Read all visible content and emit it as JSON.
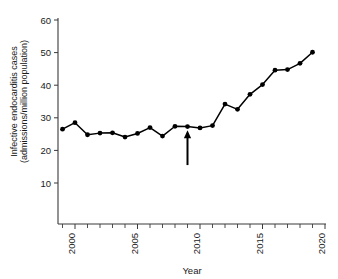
{
  "chart_data": {
    "type": "line",
    "title": "",
    "xlabel": "Year",
    "ylabel": "Infective endocarditis cases (admissions/million population)",
    "ylabel_line1": "Infective endocarditis cases",
    "ylabel_line2": "(admissions/million population)",
    "xlim": [
      1998.2,
      2020.6
    ],
    "ylim": [
      4,
      61
    ],
    "grid": false,
    "legend": "none",
    "x": [
      1999,
      2000,
      2001,
      2002,
      2003,
      2004,
      2005,
      2006,
      2007,
      2008,
      2009,
      2010,
      2011,
      2012,
      2013,
      2014,
      2015,
      2016,
      2017,
      2018,
      2019
    ],
    "values": [
      26.5,
      28.5,
      24.8,
      25.3,
      25.4,
      24.1,
      25.2,
      27.0,
      24.4,
      27.4,
      27.3,
      26.9,
      27.6,
      34.2,
      32.6,
      37.2,
      40.2,
      44.6,
      44.8,
      46.7,
      50.1
    ],
    "series": [
      {
        "name": "Infective endocarditis admissions",
        "values": [
          26.5,
          28.5,
          24.8,
          25.3,
          25.4,
          24.1,
          25.2,
          27.0,
          24.4,
          27.4,
          27.3,
          26.9,
          27.6,
          34.2,
          32.6,
          37.2,
          40.2,
          44.6,
          44.8,
          46.7,
          50.1
        ]
      }
    ],
    "y_ticks": [
      10,
      20,
      30,
      40,
      50,
      60
    ],
    "y_tick_labels": [
      "10",
      "20",
      "30",
      "40",
      "50",
      "60"
    ],
    "x_ticks": [
      2000,
      2005,
      2010,
      2015,
      2020
    ],
    "x_tick_labels": [
      "2000",
      "2005",
      "2010",
      "2015",
      "2020"
    ],
    "x_minor_ticks": [
      1999,
      2000,
      2001,
      2002,
      2003,
      2004,
      2005,
      2006,
      2007,
      2008,
      2009,
      2010,
      2011,
      2012,
      2013,
      2014,
      2015,
      2016,
      2017,
      2018,
      2019,
      2020
    ],
    "annotations": [
      {
        "name": "guideline-change-arrow",
        "type": "arrow-up",
        "x": 2009,
        "y_tip": 26.2,
        "y_tail": 15.5,
        "label": ""
      }
    ],
    "colors": {
      "series": "#000000",
      "axis": "#3a3a3a",
      "text": "#1a1a1a",
      "background": "#ffffff"
    }
  }
}
